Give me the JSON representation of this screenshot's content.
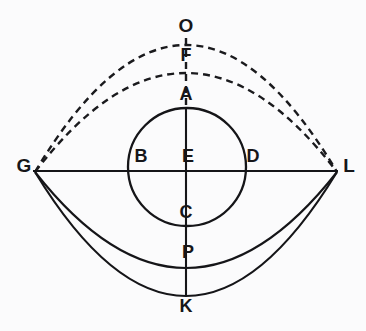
{
  "figure": {
    "background_color": "#fbfbfc",
    "ink_color": "#151518",
    "width": 366,
    "height": 331
  },
  "chart_data": {
    "type": "diagram",
    "title": "",
    "xlabel": "",
    "ylabel": "",
    "grid": false,
    "legend": false,
    "points": [
      {
        "label": "O",
        "x": 186,
        "y": 32,
        "note": "apex of outer dashed arc region, topmost labelled point"
      },
      {
        "label": "F",
        "x": 186,
        "y": 61,
        "note": "apex of inner dashed arc"
      },
      {
        "label": "A",
        "x": 186,
        "y": 100,
        "note": "top of inner circle"
      },
      {
        "label": "G",
        "x": 24,
        "y": 172,
        "note": "left end of horizontal chord"
      },
      {
        "label": "B",
        "x": 141,
        "y": 162,
        "note": "left intersection of circle with chord"
      },
      {
        "label": "E",
        "x": 188,
        "y": 162,
        "note": "center of inner circle"
      },
      {
        "label": "D",
        "x": 253,
        "y": 162,
        "note": "right intersection of circle with chord"
      },
      {
        "label": "L",
        "x": 349,
        "y": 172,
        "note": "right end of horizontal chord"
      },
      {
        "label": "C",
        "x": 186,
        "y": 218,
        "note": "bottom of inner circle"
      },
      {
        "label": "P",
        "x": 188,
        "y": 258,
        "note": "on inner lower solid arc"
      },
      {
        "label": "K",
        "x": 186,
        "y": 312,
        "note": "bottom of outer lower solid arc"
      }
    ],
    "segments": [
      {
        "name": "horizontal-chord-GL",
        "style": "solid",
        "from": [
          33,
          171
        ],
        "to": [
          338,
          171
        ]
      },
      {
        "name": "vertical-axis-upper-dashed",
        "style": "dashed",
        "from": [
          186,
          38
        ],
        "to": [
          186,
          108
        ]
      },
      {
        "name": "vertical-axis-lower-solid",
        "style": "solid",
        "from": [
          186,
          108
        ],
        "to": [
          186,
          296
        ]
      }
    ],
    "circle": {
      "name": "inner-circle-ABCD",
      "center": [
        187,
        167
      ],
      "radius": 59,
      "style": "solid"
    },
    "arcs": [
      {
        "name": "outer-dashed-arc-through-O",
        "style": "dashed",
        "from": [
          35,
          172
        ],
        "to": [
          337,
          172
        ],
        "apex": [
          186,
          45
        ],
        "side": "up"
      },
      {
        "name": "inner-dashed-arc-through-F",
        "style": "dashed",
        "from": [
          35,
          172
        ],
        "to": [
          337,
          172
        ],
        "apex": [
          186,
          73
        ],
        "side": "up"
      },
      {
        "name": "outer-solid-arc-through-K",
        "style": "solid",
        "from": [
          35,
          172
        ],
        "to": [
          337,
          172
        ],
        "apex": [
          186,
          296
        ],
        "side": "down"
      },
      {
        "name": "inner-solid-arc-through-P",
        "style": "solid",
        "from": [
          35,
          172
        ],
        "to": [
          337,
          172
        ],
        "apex": [
          186,
          268
        ],
        "side": "down"
      }
    ],
    "stroke_widths": {
      "solid": 2.1,
      "dashed": 2.4,
      "circle": 2.3
    },
    "dash_pattern": "7 5"
  },
  "labels": {
    "O": "O",
    "F": "F",
    "A": "A",
    "G": "G",
    "B": "B",
    "E": "E",
    "D": "D",
    "L": "L",
    "C": "C",
    "P": "P",
    "K": "K"
  }
}
